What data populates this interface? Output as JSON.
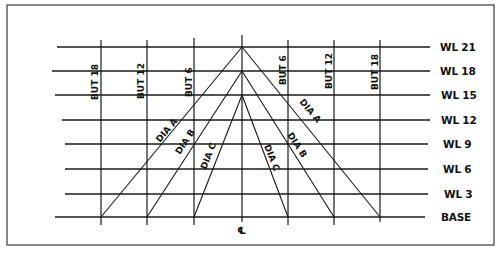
{
  "diagram": {
    "type": "lines-plan-diagram",
    "waterlines": [
      {
        "label": "WL 21",
        "y": 47,
        "x1": 57,
        "x2": 430
      },
      {
        "label": "WL 18",
        "y": 71,
        "x1": 52,
        "x2": 430
      },
      {
        "label": "WL 15",
        "y": 95,
        "x1": 55,
        "x2": 430
      },
      {
        "label": "WL 12",
        "y": 120,
        "x1": 62,
        "x2": 430
      },
      {
        "label": "WL 9",
        "y": 144,
        "x1": 65,
        "x2": 428
      },
      {
        "label": "WL 6",
        "y": 169,
        "x1": 65,
        "x2": 428
      },
      {
        "label": "WL 3",
        "y": 194,
        "x1": 65,
        "x2": 428
      },
      {
        "label": "BASE",
        "y": 217,
        "x1": 55,
        "x2": 425
      }
    ],
    "buttocks": [
      {
        "label": "BUT 18",
        "x": 101,
        "side": "left"
      },
      {
        "label": "BUT 12",
        "x": 147,
        "side": "left"
      },
      {
        "label": "BUT 6",
        "x": 194,
        "side": "left"
      },
      {
        "label": "BUT 6",
        "x": 288,
        "side": "right"
      },
      {
        "label": "BUT 12",
        "x": 334,
        "side": "right"
      },
      {
        "label": "BUT 18",
        "x": 380,
        "side": "right"
      }
    ],
    "centerline": {
      "label": "℄",
      "x": 242
    },
    "diagonals": [
      {
        "label": "DIA A",
        "apex_y": 47,
        "left_base_x": 101,
        "right_base_x": 380
      },
      {
        "label": "DIA B",
        "apex_y": 71,
        "left_base_x": 147,
        "right_base_x": 334
      },
      {
        "label": "DIA C",
        "apex_y": 95,
        "left_base_x": 194,
        "right_base_x": 288
      }
    ]
  },
  "labels": {
    "wl21": "WL 21",
    "wl18": "WL 18",
    "wl15": "WL 15",
    "wl12": "WL 12",
    "wl9": "WL 9",
    "wl6": "WL 6",
    "wl3": "WL 3",
    "base": "BASE",
    "but18_left": "BUT 18",
    "but12_left": "BUT 12",
    "but6_left": "BUT 6",
    "but6_right": "BUT 6",
    "but12_right": "BUT 12",
    "but18_right": "BUT 18",
    "dia_a_left": "DIA A",
    "dia_b_left": "DIA B",
    "dia_c_left": "DIA C",
    "dia_a_right": "DIA A",
    "dia_b_right": "DIA B",
    "dia_c_right": "DIA C",
    "centerline": "℄"
  }
}
